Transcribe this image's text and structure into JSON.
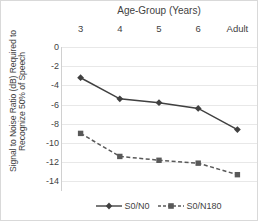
{
  "chart_data": {
    "type": "line",
    "title": "Age-Group (Years)",
    "xlabel": "Age-Group (Years)",
    "ylabel": "Signal to Noise Ratio (dB) Required to Recognize 50% of Speech",
    "ylabel_lines": [
      "Signal to Noise Ratio (dB) Required to",
      "Recognize 50% of Speech"
    ],
    "categories": [
      "3",
      "4",
      "5",
      "6",
      "Adult"
    ],
    "yticks": [
      0,
      -2,
      -4,
      -6,
      -8,
      -10,
      -12,
      -14
    ],
    "ytick_labels": [
      "0",
      "-2",
      "-4",
      "-6",
      "-8",
      "-10",
      "-12",
      "-14"
    ],
    "ylim": [
      -15,
      0
    ],
    "grid": true,
    "legend_position": "bottom",
    "series": [
      {
        "name": "S0/N0",
        "values": [
          -3.2,
          -5.4,
          -5.8,
          -6.4,
          -8.6
        ],
        "color": "#404040",
        "linestyle": "solid",
        "marker": "diamond"
      },
      {
        "name": "S0/N180",
        "values": [
          -9.0,
          -11.4,
          -11.8,
          -12.1,
          -13.3
        ],
        "color": "#595959",
        "linestyle": "dashed",
        "marker": "square"
      }
    ]
  },
  "legend": {
    "items": [
      {
        "label": "S0/N0"
      },
      {
        "label": "S0/N180"
      }
    ]
  }
}
